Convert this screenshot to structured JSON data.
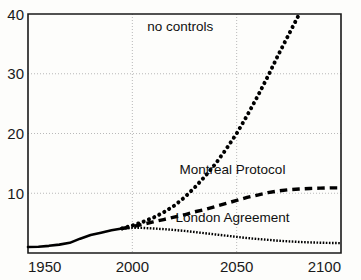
{
  "chart_data": {
    "type": "line",
    "title": "",
    "subtitle": "",
    "xlabel": "",
    "ylabel": "",
    "xlim": [
      1950,
      2100
    ],
    "ylim": [
      0,
      40
    ],
    "xticks": [
      1950,
      2000,
      2050,
      2100
    ],
    "yticks": [
      10,
      20,
      30,
      40
    ],
    "xtick_labels": [
      "1950",
      "2000",
      "2050",
      "2100"
    ],
    "ytick_labels": [
      "10",
      "20",
      "30",
      "40"
    ],
    "grid": true,
    "grid_style": "dotted",
    "legend_position": "inline-annotations",
    "series": [
      {
        "name": "historical",
        "label": "",
        "style": "solid",
        "color": "#000000",
        "width": 2.6,
        "x": [
          1950,
          1955,
          1960,
          1965,
          1970,
          1975,
          1980,
          1985,
          1990,
          1995
        ],
        "values": [
          1.0,
          1.05,
          1.2,
          1.4,
          1.7,
          2.4,
          3.0,
          3.4,
          3.8,
          4.1
        ]
      },
      {
        "name": "no-controls",
        "label": "no controls",
        "style": "dotted",
        "color": "#000000",
        "width": 4.0,
        "x": [
          1995,
          2000,
          2005,
          2010,
          2015,
          2020,
          2025,
          2030,
          2035,
          2040,
          2045,
          2050,
          2055,
          2060,
          2065,
          2070,
          2075,
          2080
        ],
        "values": [
          4.1,
          4.6,
          5.2,
          5.9,
          6.8,
          7.9,
          9.3,
          11.0,
          12.9,
          15.0,
          17.4,
          20.0,
          23.0,
          26.2,
          29.6,
          33.2,
          36.6,
          40.0
        ]
      },
      {
        "name": "montreal-protocol",
        "label": "Montreal Protocol",
        "style": "dashed",
        "color": "#000000",
        "width": 3.4,
        "x": [
          1995,
          2000,
          2005,
          2010,
          2015,
          2020,
          2025,
          2030,
          2035,
          2040,
          2045,
          2050,
          2055,
          2060,
          2065,
          2070,
          2075,
          2080,
          2085,
          2090,
          2095,
          2100
        ],
        "values": [
          4.1,
          4.4,
          4.8,
          5.2,
          5.6,
          6.0,
          6.4,
          6.9,
          7.3,
          7.8,
          8.3,
          8.8,
          9.3,
          9.7,
          10.1,
          10.4,
          10.6,
          10.7,
          10.8,
          10.85,
          10.9,
          10.9
        ]
      },
      {
        "name": "london-agreement",
        "label": "London Agreement",
        "style": "fine-dotted",
        "color": "#000000",
        "width": 2.4,
        "x": [
          1995,
          2000,
          2005,
          2010,
          2015,
          2020,
          2025,
          2030,
          2035,
          2040,
          2045,
          2050,
          2055,
          2060,
          2065,
          2070,
          2075,
          2080,
          2085,
          2090,
          2095,
          2100
        ],
        "values": [
          4.1,
          4.2,
          4.2,
          4.1,
          4.0,
          3.85,
          3.7,
          3.5,
          3.3,
          3.1,
          2.9,
          2.7,
          2.5,
          2.35,
          2.2,
          2.05,
          1.95,
          1.85,
          1.78,
          1.72,
          1.68,
          1.65
        ]
      }
    ],
    "annotations": [
      {
        "text": "no controls",
        "x": 2023,
        "y": 37.2
      },
      {
        "text": "Montreal Protocol",
        "x": 2048,
        "y": 13.2
      },
      {
        "text": "London Agreement",
        "x": 2048,
        "y": 5.2
      }
    ],
    "colors": {
      "line": "#000000",
      "grid": "#b9b9b9",
      "axis": "#1a1a1a",
      "background": "#fdfdfb"
    }
  }
}
